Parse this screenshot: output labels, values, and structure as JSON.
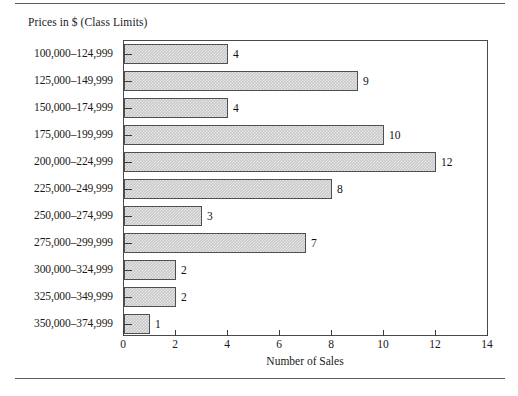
{
  "figure": {
    "top_rule": "",
    "bottom_rule": ""
  },
  "chart_data": {
    "type": "bar",
    "orientation": "horizontal",
    "title": "",
    "ylabel": "Prices in $ (Class Limits)",
    "xlabel": "Number of Sales",
    "xlim": [
      0,
      14
    ],
    "xticks": [
      "0",
      "2",
      "4",
      "6",
      "8",
      "10",
      "12",
      "14"
    ],
    "xtick_values": [
      0,
      2,
      4,
      6,
      8,
      10,
      12,
      14
    ],
    "grid": false,
    "legend": "none",
    "bar_fill_color": "#c9c9c9",
    "bar_edge_color": "#4f4f4f",
    "categories": [
      "100,000–124,999",
      "125,000–149,999",
      "150,000–174,999",
      "175,000–199,999",
      "200,000–224,999",
      "225,000–249,999",
      "250,000–274,999",
      "275,000–299,999",
      "300,000–324,999",
      "325,000–349,999",
      "350,000–374,999"
    ],
    "values": [
      4,
      9,
      4,
      10,
      12,
      8,
      3,
      7,
      2,
      2,
      1
    ],
    "data_labels": [
      "4",
      "9",
      "4",
      "10",
      "12",
      "8",
      "3",
      "7",
      "2",
      "2",
      "1"
    ]
  }
}
